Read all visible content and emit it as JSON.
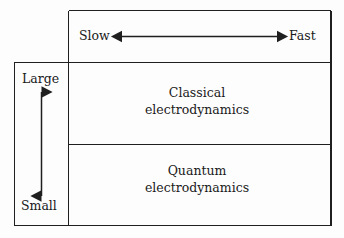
{
  "diagram": {
    "axes": {
      "horizontal": {
        "name": "speed-axis",
        "left_label": "Slow",
        "right_label": "Fast",
        "arrow": "double-headed-horizontal-arrow"
      },
      "vertical": {
        "name": "size-axis",
        "top_label": "Large",
        "bottom_label": "Small",
        "arrow": "double-headed-vertical-arrow"
      }
    },
    "cells": [
      {
        "name": "classical-cell",
        "line1": "Classical",
        "line2": "electrodynamics"
      },
      {
        "name": "quantum-cell",
        "line1": "Quantum",
        "line2": "electrodynamics"
      }
    ],
    "colors": {
      "background": "#fdfdfd",
      "stroke": "#1f1f1f",
      "text": "#1a1a1a"
    }
  }
}
